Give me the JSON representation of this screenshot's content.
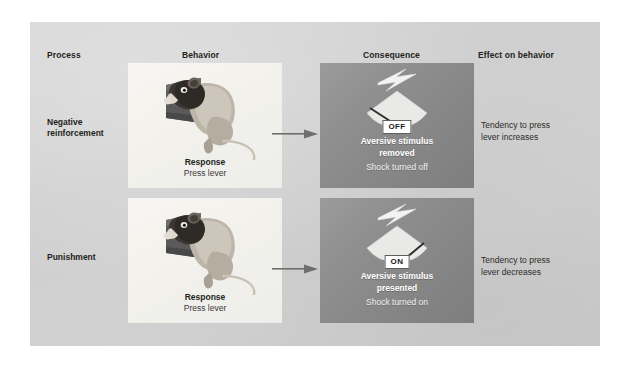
{
  "figure": {
    "headers": [
      {
        "key": "process",
        "label": "Process"
      },
      {
        "key": "behavior",
        "label": "Behavior"
      },
      {
        "key": "consequence",
        "label": "Consequence"
      },
      {
        "key": "effect",
        "label": "Effect on behavior"
      }
    ],
    "colors": {
      "page_background": "#ffffff",
      "panel_background": "#d1d1d1",
      "behavior_panel": "#f4f3ef",
      "consequence_panel": "#8b8b8b",
      "badge_background": "#ffffff",
      "text_dark": "#231f20",
      "text_light": "#ffffff",
      "arrow": "#6b6b6b"
    },
    "rows": [
      {
        "process": {
          "line1": "Negative",
          "line2": "reinforcement"
        },
        "behavior": {
          "response_title": "Response",
          "response_sub": "Press lever",
          "illustration": "rat-pressing-lever"
        },
        "consequence": {
          "badge": "OFF",
          "title_line1": "Aversive stimulus",
          "title_line2": "removed",
          "subtitle": "Shock turned off",
          "illustration": "lightning-bolt-over-shock-grid"
        },
        "effect": {
          "line1": "Tendency to press",
          "line2": "lever increases"
        }
      },
      {
        "process": {
          "line1": "Punishment",
          "line2": ""
        },
        "behavior": {
          "response_title": "Response",
          "response_sub": "Press lever",
          "illustration": "rat-pressing-lever"
        },
        "consequence": {
          "badge": "ON",
          "title_line1": "Aversive stimulus",
          "title_line2": "presented",
          "subtitle": "Shock turned on",
          "illustration": "lightning-bolt-over-shock-grid"
        },
        "effect": {
          "line1": "Tendency to press",
          "line2": "lever decreases"
        }
      }
    ]
  }
}
